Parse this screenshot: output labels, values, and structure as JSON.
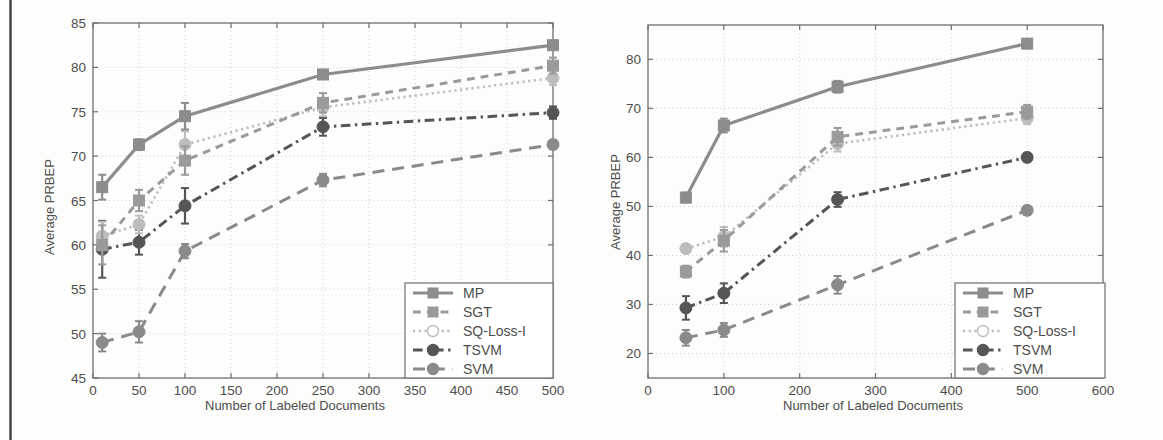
{
  "figure": {
    "background_color": "#fdfdfc",
    "axis_color": "#6e6e6e",
    "grid_color": "#c9c9c9",
    "text_color": "#4d4d4d"
  },
  "series_styles": [
    {
      "key": "MP",
      "label": "MP",
      "color": "#8c8c8c",
      "dash": "none",
      "marker": "square",
      "width": 3.2
    },
    {
      "key": "SGT",
      "label": "SGT",
      "color": "#9a9a9a",
      "dash": "dashed",
      "marker": "square",
      "width": 3.0
    },
    {
      "key": "SQ-Loss-I",
      "label": "SQ-Loss-I",
      "color": "#bdbdbd",
      "dash": "dotted",
      "marker": "circle",
      "width": 2.6
    },
    {
      "key": "TSVM",
      "label": "TSVM",
      "color": "#555555",
      "dash": "dashdot",
      "marker": "circle",
      "width": 3.0
    },
    {
      "key": "SVM",
      "label": "SVM",
      "color": "#8a8a8a",
      "dash": "longdash",
      "marker": "circle",
      "width": 3.0
    }
  ],
  "charts": [
    {
      "id": "left-chart",
      "name": "average-prbep-vs-labeled-documents-left"
    },
    {
      "id": "right-chart",
      "name": "average-prbep-vs-labeled-documents-right"
    }
  ],
  "chart_data": [
    {
      "type": "line",
      "title": "",
      "xlabel": "Number of Labeled Documents",
      "ylabel": "Average PRBEP",
      "xlim": [
        0,
        500
      ],
      "ylim": [
        45,
        85
      ],
      "xticks": [
        0,
        50,
        100,
        150,
        200,
        250,
        300,
        350,
        400,
        450,
        500
      ],
      "yticks": [
        45,
        50,
        55,
        60,
        65,
        70,
        75,
        80,
        85
      ],
      "grid": true,
      "legend_position": "lower-right",
      "x": [
        10,
        50,
        100,
        250,
        500
      ],
      "series": [
        {
          "name": "MP",
          "values": [
            66.5,
            71.3,
            74.5,
            79.2,
            82.5
          ],
          "errors": [
            1.4,
            0.6,
            1.5,
            0.5,
            0.4
          ]
        },
        {
          "name": "SGT",
          "values": [
            60.0,
            65.0,
            69.5,
            76.0,
            80.2
          ],
          "errors": [
            2.2,
            1.2,
            1.6,
            1.1,
            0.9
          ]
        },
        {
          "name": "SQ-Loss-I",
          "values": [
            61.0,
            62.3,
            71.3,
            75.5,
            78.8
          ],
          "errors": [
            1.6,
            1.0,
            1.5,
            1.0,
            0.8
          ]
        },
        {
          "name": "TSVM",
          "values": [
            59.5,
            60.3,
            64.4,
            73.3,
            74.9
          ],
          "errors": [
            3.2,
            1.4,
            2.0,
            1.0,
            0.7
          ]
        },
        {
          "name": "SVM",
          "values": [
            49.0,
            50.2,
            59.3,
            67.3,
            71.3
          ],
          "errors": [
            1.0,
            1.2,
            0.8,
            0.7,
            0.5
          ]
        }
      ]
    },
    {
      "type": "line",
      "title": "",
      "xlabel": "Number of Labeled Documents",
      "ylabel": "Average PRBEP",
      "xlim": [
        0,
        600
      ],
      "ylim": [
        15,
        87
      ],
      "xticks": [
        0,
        100,
        200,
        300,
        400,
        500,
        600
      ],
      "yticks": [
        20,
        30,
        40,
        50,
        60,
        70,
        80
      ],
      "grid": true,
      "legend_position": "lower-right",
      "x": [
        50,
        100,
        250,
        500
      ],
      "series": [
        {
          "name": "MP",
          "values": [
            51.8,
            66.5,
            74.4,
            83.2
          ],
          "errors": [
            1.0,
            1.4,
            1.2,
            0.5
          ]
        },
        {
          "name": "SGT",
          "values": [
            36.7,
            43.0,
            64.2,
            69.3
          ],
          "errors": [
            1.2,
            2.2,
            1.8,
            1.4
          ]
        },
        {
          "name": "SQ-Loss-I",
          "values": [
            41.4,
            43.8,
            62.8,
            68.0
          ],
          "errors": [
            0.9,
            2.0,
            1.6,
            1.2
          ]
        },
        {
          "name": "TSVM",
          "values": [
            29.3,
            32.3,
            51.4,
            60.0
          ],
          "errors": [
            2.4,
            2.0,
            1.5,
            0.8
          ]
        },
        {
          "name": "SVM",
          "values": [
            23.2,
            24.8,
            34.0,
            49.2
          ],
          "errors": [
            1.6,
            1.4,
            1.8,
            0.9
          ]
        }
      ]
    }
  ],
  "legend": {
    "entries": [
      "MP",
      "SGT",
      "SQ-Loss-I",
      "TSVM",
      "SVM"
    ]
  },
  "labels": {
    "xlabel": "Number of Labeled Documents",
    "ylabel": "Average PRBEP"
  }
}
